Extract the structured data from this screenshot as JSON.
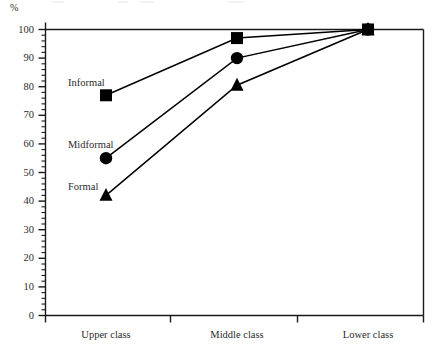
{
  "chart_data": {
    "type": "line",
    "title": "",
    "subtitle": "",
    "xlabel": "",
    "ylabel": "%",
    "categories": [
      "Upper class",
      "Middle class",
      "Lower class"
    ],
    "series": [
      {
        "name": "Informal",
        "marker": "square",
        "values": [
          77,
          97,
          100
        ]
      },
      {
        "name": "Midformal",
        "marker": "circle",
        "values": [
          55,
          90,
          100
        ]
      },
      {
        "name": "Formal",
        "marker": "triangle",
        "values": [
          42,
          80.5,
          100
        ]
      }
    ],
    "ylim": [
      0,
      100
    ],
    "ytick_labels": [
      "0",
      "10",
      "20",
      "30",
      "40",
      "50",
      "60",
      "70",
      "80",
      "90",
      "100"
    ],
    "ytick_values": [
      0,
      10,
      20,
      30,
      40,
      50,
      60,
      70,
      80,
      90,
      100
    ],
    "yminor_step": 2,
    "grid": false,
    "legend": "inline-labels",
    "legend_position": "inside-left",
    "axis_color": "#1a1a1a",
    "series_color": "#000000",
    "background": "#ffffff"
  },
  "axes": {
    "unit_label": "%"
  },
  "annotations": {
    "series_labels": [
      {
        "text": "Informal",
        "x": 68,
        "y": 78
      },
      {
        "text": "Midformal",
        "x": 68,
        "y": 140
      },
      {
        "text": "Formal",
        "x": 68,
        "y": 182
      }
    ]
  }
}
